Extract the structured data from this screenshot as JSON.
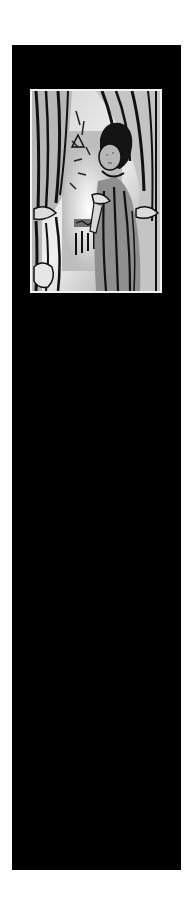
{
  "panel": {
    "background": "#000000"
  },
  "illustration": {
    "subject": "woodcut-style figure standing between parted curtains",
    "alt": "Woodcut illustration of a figure peeking between curtains",
    "frame_color": "#f2f2f2"
  }
}
